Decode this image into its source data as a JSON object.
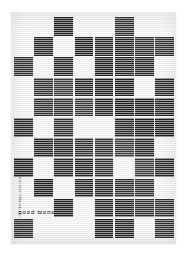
{
  "poster": {
    "title": "goed wonen",
    "credits_line": "een uitgave van de stichting",
    "credits_line2": "goed wonen amsterdam 1957",
    "paper_color": "#f2f2f0",
    "ink_color": "#262626",
    "background_color": "#ffffff"
  },
  "grid": {
    "columns": 8,
    "rows": 13,
    "cell_size_px": 18.6,
    "gap_px": 1.6,
    "origin_x_px": 3,
    "origin_y_px": 5,
    "legend": "1 = dark square, 0 = empty paper",
    "pattern": [
      [
        0,
        0,
        1,
        0,
        0,
        1,
        0,
        0
      ],
      [
        0,
        1,
        0,
        1,
        1,
        1,
        1,
        1
      ],
      [
        1,
        0,
        1,
        0,
        1,
        1,
        1,
        0
      ],
      [
        0,
        1,
        1,
        1,
        1,
        1,
        0,
        1
      ],
      [
        0,
        1,
        1,
        1,
        1,
        1,
        1,
        1
      ],
      [
        1,
        0,
        1,
        0,
        0,
        1,
        1,
        1
      ],
      [
        0,
        1,
        1,
        1,
        1,
        1,
        1,
        0
      ],
      [
        1,
        0,
        1,
        1,
        1,
        0,
        1,
        1
      ],
      [
        0,
        1,
        0,
        1,
        1,
        1,
        1,
        0
      ],
      [
        0,
        0,
        1,
        0,
        1,
        1,
        1,
        1
      ],
      [
        1,
        0,
        0,
        0,
        1,
        1,
        0,
        1
      ]
    ]
  },
  "icons": {
    "poster_sheet": "poster-sheet"
  }
}
